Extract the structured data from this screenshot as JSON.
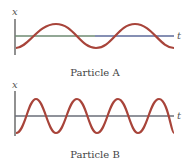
{
  "figure": {
    "panels": [
      {
        "id": "particle-a",
        "caption": "Particle A",
        "y_axis_label": "x",
        "x_axis_label": "t",
        "wave": {
          "amplitude_px": 12,
          "period_px": 78,
          "start_phase": "minimum",
          "cycles_shown": 2,
          "color": "#a8443a"
        },
        "axis_color": "#6b7f8c"
      },
      {
        "id": "particle-b",
        "caption": "Particle B",
        "y_axis_label": "x",
        "x_axis_label": "t",
        "wave": {
          "amplitude_px": 17,
          "period_px": 41,
          "start_phase": "minimum",
          "cycles_shown": 4,
          "color": "#a8443a"
        },
        "axis_color": "#6a6e78"
      }
    ]
  }
}
